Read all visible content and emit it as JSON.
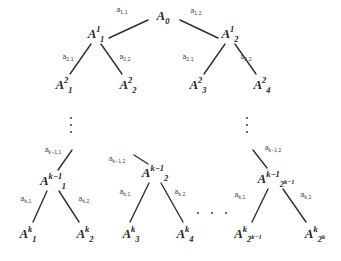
{
  "figure": {
    "stroke_color": "#2f2f2f",
    "text_color": "#262626",
    "background": "#ffffff"
  },
  "nodes": [
    {
      "id": "root",
      "base": "A",
      "sub": "0",
      "sup": "",
      "x": 163,
      "y": 15,
      "label": "A_0"
    },
    {
      "id": "n1_1",
      "base": "A",
      "sub": "1",
      "sup": "1",
      "x": 96,
      "y": 33,
      "label": "A_1^1"
    },
    {
      "id": "n1_2",
      "base": "A",
      "sub": "2",
      "sup": "1",
      "x": 230,
      "y": 33,
      "label": "A_2^1"
    },
    {
      "id": "n2_1",
      "base": "A",
      "sub": "1",
      "sup": "2",
      "x": 64,
      "y": 84,
      "label": "A_1^2"
    },
    {
      "id": "n2_2",
      "base": "A",
      "sub": "2",
      "sup": "2",
      "x": 128,
      "y": 84,
      "label": "A_2^2"
    },
    {
      "id": "n2_3",
      "base": "A",
      "sub": "3",
      "sup": "2",
      "x": 198,
      "y": 84,
      "label": "A_3^2"
    },
    {
      "id": "n2_4",
      "base": "A",
      "sub": "4",
      "sup": "2",
      "x": 262,
      "y": 84,
      "label": "A_4^2"
    },
    {
      "id": "nk1_1",
      "base": "A",
      "sub": "1",
      "sup": "k−1",
      "x": 53,
      "y": 180,
      "label": "A_1^{k-1}"
    },
    {
      "id": "nk1_2",
      "base": "A",
      "sub": "2",
      "sup": "k−1",
      "x": 155,
      "y": 172,
      "label": "A_2^{k-1}"
    },
    {
      "id": "nk1_3",
      "base": "A",
      "sub": "2^{k−1}",
      "sup": "k−1",
      "x": 276,
      "y": 178,
      "label": "A_{2^{k-1}}^{k-1}"
    },
    {
      "id": "nk_1",
      "base": "A",
      "sub": "1",
      "sup": "k",
      "x": 28,
      "y": 233,
      "label": "A_1^k"
    },
    {
      "id": "nk_2",
      "base": "A",
      "sub": "2",
      "sup": "k",
      "x": 85,
      "y": 233,
      "label": "A_2^k"
    },
    {
      "id": "nk_3",
      "base": "A",
      "sub": "3",
      "sup": "k",
      "x": 131,
      "y": 233,
      "label": "A_3^k"
    },
    {
      "id": "nk_4",
      "base": "A",
      "sub": "4",
      "sup": "k",
      "x": 185,
      "y": 233,
      "label": "A_4^k"
    },
    {
      "id": "nk_5",
      "base": "A",
      "sub": "2^k−1",
      "sup": "k",
      "x": 248,
      "y": 233,
      "label": "A_{2^k-1}^k"
    },
    {
      "id": "nk_6",
      "base": "A",
      "sub": "2^k",
      "sup": "k",
      "x": 315,
      "y": 233,
      "label": "A_{2^k}^k"
    }
  ],
  "edges": [
    {
      "from": "root",
      "to": "n1_1",
      "x1": 148,
      "y1": 20,
      "x2": 109,
      "y2": 38
    },
    {
      "from": "root",
      "to": "n1_2",
      "x1": 180,
      "y1": 20,
      "x2": 218,
      "y2": 38
    },
    {
      "from": "n1_1",
      "to": "n2_1",
      "x1": 91,
      "y1": 44,
      "x2": 70,
      "y2": 74
    },
    {
      "from": "n1_1",
      "to": "n2_2",
      "x1": 101,
      "y1": 44,
      "x2": 122,
      "y2": 74
    },
    {
      "from": "n1_2",
      "to": "n2_3",
      "x1": 225,
      "y1": 44,
      "x2": 204,
      "y2": 74
    },
    {
      "from": "n1_2",
      "to": "n2_4",
      "x1": 235,
      "y1": 44,
      "x2": 256,
      "y2": 74
    },
    {
      "from": "vdots-left",
      "to": "nk1_1",
      "x1": 72,
      "y1": 150,
      "x2": 58,
      "y2": 170
    },
    {
      "from": "vdots-mid",
      "to": "nk1_2",
      "x1": 134,
      "y1": 155,
      "x2": 148,
      "y2": 164
    },
    {
      "from": "vdots-right",
      "to": "nk1_3",
      "x1": 253,
      "y1": 150,
      "x2": 267,
      "y2": 168
    },
    {
      "from": "nk1_1",
      "to": "nk_1",
      "x1": 47,
      "y1": 191,
      "x2": 33,
      "y2": 222
    },
    {
      "from": "nk1_1",
      "to": "nk_2",
      "x1": 59,
      "y1": 191,
      "x2": 79,
      "y2": 222
    },
    {
      "from": "nk1_2",
      "to": "nk_3",
      "x1": 149,
      "y1": 183,
      "x2": 130,
      "y2": 222
    },
    {
      "from": "nk1_2",
      "to": "nk_4",
      "x1": 161,
      "y1": 183,
      "x2": 183,
      "y2": 222
    },
    {
      "from": "nk1_3",
      "to": "nk_5",
      "x1": 268,
      "y1": 189,
      "x2": 252,
      "y2": 222
    },
    {
      "from": "nk1_3",
      "to": "nk_6",
      "x1": 283,
      "y1": 189,
      "x2": 306,
      "y2": 222
    }
  ],
  "edge_labels": [
    {
      "id": "e_1_1",
      "base": "a",
      "sub": "1,1",
      "x": 122,
      "y": 10,
      "text": "a_{1,1}"
    },
    {
      "id": "e_1_2",
      "base": "a",
      "sub": "1,2",
      "x": 196,
      "y": 11,
      "text": "a_{1,2}"
    },
    {
      "id": "e_2_1_L",
      "base": "a",
      "sub": "2,1",
      "x": 68,
      "y": 57,
      "text": "a_{2,1}"
    },
    {
      "id": "e_2_2_L",
      "base": "a",
      "sub": "2,2",
      "x": 125,
      "y": 57,
      "text": "a_{2,2}"
    },
    {
      "id": "e_2_1_R",
      "base": "a",
      "sub": "2,1",
      "x": 188,
      "y": 57,
      "text": "a_{2,1}"
    },
    {
      "id": "e_2_2_R",
      "base": "a",
      "sub": "2,2",
      "x": 246,
      "y": 57,
      "text": "a_{2,2}"
    },
    {
      "id": "e_km1_1",
      "base": "a",
      "sub": "k−1,1",
      "x": 53,
      "y": 150,
      "text": "a_{k-1,1}"
    },
    {
      "id": "e_km1_2_M",
      "base": "a",
      "sub": "k−1,2",
      "x": 117,
      "y": 159,
      "text": "a_{k-1,2}"
    },
    {
      "id": "e_km1_2_R",
      "base": "a",
      "sub": "k−1,2",
      "x": 273,
      "y": 148,
      "text": "a_{k-1,2}"
    },
    {
      "id": "e_k_1_L",
      "base": "a",
      "sub": "k,1",
      "x": 26,
      "y": 199,
      "text": "a_{k,1}"
    },
    {
      "id": "e_k_2_L",
      "base": "a",
      "sub": "k,2",
      "x": 84,
      "y": 199,
      "text": "a_{k,2}"
    },
    {
      "id": "e_k_1_M",
      "base": "a",
      "sub": "k,1",
      "x": 125,
      "y": 192,
      "text": "a_{k,1}"
    },
    {
      "id": "e_k_2_M",
      "base": "a",
      "sub": "k,2",
      "x": 180,
      "y": 192,
      "text": "a_{k,2}"
    },
    {
      "id": "e_k_1_R",
      "base": "a",
      "sub": "k,1",
      "x": 240,
      "y": 195,
      "text": "a_{k,1}"
    },
    {
      "id": "e_k_2_R",
      "base": "a",
      "sub": "k,2",
      "x": 306,
      "y": 195,
      "text": "a_{k,2}"
    }
  ],
  "ellipses": [
    {
      "id": "vdots-left",
      "orientation": "vertical",
      "x": 71,
      "y": 125,
      "dots": 3
    },
    {
      "id": "vdots-right",
      "orientation": "vertical",
      "x": 247,
      "y": 125,
      "dots": 3
    },
    {
      "id": "hdots-bottom",
      "orientation": "horizontal",
      "x": 212,
      "y": 213,
      "dots": 3
    }
  ]
}
